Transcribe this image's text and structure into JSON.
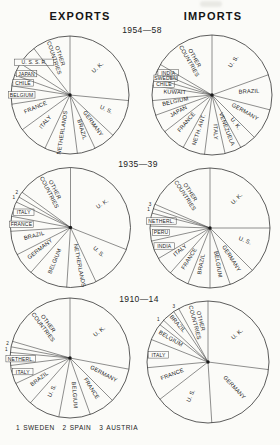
{
  "page": {
    "columns": [
      {
        "title": "EXPORTS"
      },
      {
        "title": "IMPORTS"
      }
    ],
    "periods": [
      "1954—58",
      "1935—39",
      "1910—14"
    ],
    "legend": {
      "items": [
        {
          "num": "1",
          "label": "SWEDEN"
        },
        {
          "num": "2",
          "label": "SPAIN"
        },
        {
          "num": "3",
          "label": "AUSTRIA"
        }
      ]
    }
  },
  "chart_data": [
    {
      "type": "pie",
      "group": "EXPORTS",
      "period": "1954—58",
      "unit": "percent share (estimated from slice angles)",
      "start_angle_deg": 0,
      "direction": "clockwise",
      "slices": [
        {
          "label": "U. K.",
          "value": 26.5,
          "label_style": "radial",
          "d": 0.66
        },
        {
          "label": "U. S.",
          "value": 10.5,
          "label_style": "radial",
          "d": 0.66
        },
        {
          "label": "GERMANY",
          "value": 6,
          "label_style": "radial"
        },
        {
          "label": "BRAZIL",
          "value": 5,
          "label_style": "radial"
        },
        {
          "label": "NETHERLANDS",
          "value": 9,
          "label_style": "radial",
          "d": 0.65
        },
        {
          "label": "ITALY",
          "value": 8,
          "label_style": "radial"
        },
        {
          "label": "FRANCE",
          "value": 7.5,
          "label_style": "radial"
        },
        {
          "label": "BELGIUM",
          "value": 5,
          "label_style": "box"
        },
        {
          "label": "CHILE",
          "value": 3,
          "label_style": "box"
        },
        {
          "label": "JAPAN",
          "value": 3.5,
          "label_style": "box"
        },
        {
          "label": "U. S. S. R.",
          "value": 5.5,
          "label_style": "box"
        },
        {
          "label": "OTHER COUNTRIES",
          "value": 10.5,
          "label_style": "radial2"
        }
      ]
    },
    {
      "type": "pie",
      "group": "IMPORTS",
      "period": "1954—58",
      "unit": "percent share (estimated from slice angles)",
      "start_angle_deg": 0,
      "direction": "clockwise",
      "slices": [
        {
          "label": "U. S.",
          "value": 19.5,
          "label_style": "radial",
          "d": 0.66
        },
        {
          "label": "BRAZIL",
          "value": 9.5,
          "label_style": "radial"
        },
        {
          "label": "GERMANY",
          "value": 8.5,
          "label_style": "radial"
        },
        {
          "label": "U. K.",
          "value": 4.5,
          "label_style": "radial"
        },
        {
          "label": "VENEZUELA",
          "value": 4.5,
          "label_style": "radial"
        },
        {
          "label": "ITALY",
          "value": 5.5,
          "label_style": "radial"
        },
        {
          "label": "NETH. ANT.",
          "value": 6,
          "label_style": "radial"
        },
        {
          "label": "FRANCE",
          "value": 6.5,
          "label_style": "radial"
        },
        {
          "label": "JAPAN",
          "value": 5,
          "label_style": "radial"
        },
        {
          "label": "BELGIUM",
          "value": 4,
          "label_style": "radial"
        },
        {
          "label": "KUWAIT",
          "value": 4,
          "label_style": "radial"
        },
        {
          "label": "CHILE",
          "value": 2,
          "label_style": "box"
        },
        {
          "label": "SWEDEN",
          "value": 2,
          "label_style": "box"
        },
        {
          "label": "INDIA",
          "value": 2,
          "label_style": "box"
        },
        {
          "label": "OTHER COUNTRIES",
          "value": 16.5,
          "label_style": "radial2"
        }
      ]
    },
    {
      "type": "pie",
      "group": "EXPORTS",
      "period": "1935—39",
      "unit": "percent share (estimated from slice angles)",
      "start_angle_deg": 0,
      "direction": "clockwise",
      "slices": [
        {
          "label": "U. K.",
          "value": 31,
          "label_style": "radial",
          "d": 0.66
        },
        {
          "label": "U. S.",
          "value": 12,
          "label_style": "radial"
        },
        {
          "label": "NETHERLANDS",
          "value": 8,
          "label_style": "radial",
          "d": 0.65
        },
        {
          "label": "BELGIUM",
          "value": 10.5,
          "label_style": "radial"
        },
        {
          "label": "GERMANY",
          "value": 6,
          "label_style": "radial"
        },
        {
          "label": "BRAZIL",
          "value": 6.5,
          "label_style": "radial"
        },
        {
          "label": "FRANCE",
          "value": 4,
          "label_style": "box"
        },
        {
          "label": "ITALY",
          "value": 4,
          "label_style": "box"
        },
        {
          "label": "1",
          "country": "SWEDEN",
          "value": 1.5,
          "label_style": "tick"
        },
        {
          "label": "2",
          "country": "SPAIN",
          "value": 1.5,
          "label_style": "tick"
        },
        {
          "label": "OTHER COUNTRIES",
          "value": 15,
          "label_style": "radial2"
        }
      ]
    },
    {
      "type": "pie",
      "group": "IMPORTS",
      "period": "1935—39",
      "unit": "percent share (estimated from slice angles)",
      "start_angle_deg": 0,
      "direction": "clockwise",
      "slices": [
        {
          "label": "U. K.",
          "value": 25,
          "label_style": "radial",
          "d": 0.66
        },
        {
          "label": "U. S.",
          "value": 12.5,
          "label_style": "radial"
        },
        {
          "label": "GERMANY",
          "value": 7,
          "label_style": "radial"
        },
        {
          "label": "BELGIUM",
          "value": 5.5,
          "label_style": "radial"
        },
        {
          "label": "BRAZIL",
          "value": 6,
          "label_style": "radial"
        },
        {
          "label": "FRANCE",
          "value": 5.5,
          "label_style": "radial"
        },
        {
          "label": "ITALY",
          "value": 5,
          "label_style": "radial"
        },
        {
          "label": "INDIA",
          "value": 5,
          "label_style": "box"
        },
        {
          "label": "PERU",
          "value": 4,
          "label_style": "box"
        },
        {
          "label": "NETHERL.",
          "value": 3.5,
          "label_style": "box"
        },
        {
          "label": "1",
          "country": "SWEDEN",
          "value": 1.25,
          "label_style": "tick"
        },
        {
          "label": "3",
          "country": "AUSTRIA",
          "value": 1.25,
          "label_style": "tick"
        },
        {
          "label": "OTHER COUNTRIES",
          "value": 18.5,
          "label_style": "radial2"
        }
      ]
    },
    {
      "type": "pie",
      "group": "EXPORTS",
      "period": "1910—14",
      "unit": "percent share (estimated from slice angles)",
      "start_angle_deg": 0,
      "direction": "clockwise",
      "slices": [
        {
          "label": "U. K.",
          "value": 28,
          "label_style": "radial",
          "d": 0.66
        },
        {
          "label": "GERMANY",
          "value": 9.5,
          "label_style": "radial"
        },
        {
          "label": "FRANCE",
          "value": 7,
          "label_style": "radial"
        },
        {
          "label": "BELGIUM",
          "value": 8.5,
          "label_style": "radial"
        },
        {
          "label": "U. S.",
          "value": 8.5,
          "label_style": "radial"
        },
        {
          "label": "BRAZIL",
          "value": 6.5,
          "label_style": "radial"
        },
        {
          "label": "ITALY",
          "value": 5,
          "label_style": "box"
        },
        {
          "label": "NETHERL.",
          "value": 3.5,
          "label_style": "box"
        },
        {
          "label": "1",
          "country": "SWEDEN",
          "value": 1.5,
          "label_style": "tick"
        },
        {
          "label": "2",
          "country": "SPAIN",
          "value": 1.5,
          "label_style": "tick"
        },
        {
          "label": "OTHER COUNTRIES",
          "value": 20.5,
          "label_style": "radial2"
        }
      ]
    },
    {
      "type": "pie",
      "group": "IMPORTS",
      "period": "1910—14",
      "unit": "percent share (estimated from slice angles)",
      "start_angle_deg": 0,
      "direction": "clockwise",
      "slices": [
        {
          "label": "U. K.",
          "value": 27,
          "label_style": "radial",
          "d": 0.66
        },
        {
          "label": "GERMANY",
          "value": 22,
          "label_style": "radial",
          "d": 0.6
        },
        {
          "label": "U. S.",
          "value": 15.5,
          "label_style": "radial"
        },
        {
          "label": "FRANCE",
          "value": 9,
          "label_style": "radial"
        },
        {
          "label": "ITALY",
          "value": 7.5,
          "label_style": "box"
        },
        {
          "label": "BELGIUM",
          "value": 4.5,
          "label_style": "radial",
          "d": 0.72
        },
        {
          "label": "1",
          "country": "SWEDEN",
          "value": 1.5,
          "label_style": "tick"
        },
        {
          "label": "BRAZIL",
          "value": 3.5,
          "label_style": "radial",
          "d": 0.8
        },
        {
          "label": "3",
          "country": "AUSTRIA",
          "value": 1.5,
          "label_style": "tick"
        },
        {
          "label": "OTHER COUNTRIES",
          "value": 8,
          "label_style": "radial2"
        }
      ]
    }
  ]
}
